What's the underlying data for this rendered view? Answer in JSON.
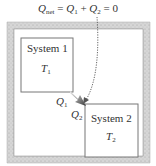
{
  "equation": {
    "lhs_symbol": "Q",
    "lhs_subscript": "net",
    "eq1": "=",
    "term1_symbol": "Q",
    "term1_subscript": "1",
    "plus": "+",
    "term2_symbol": "Q",
    "term2_subscript": "2",
    "eq2": "=",
    "rhs": "0"
  },
  "system1": {
    "label": "System 1",
    "temp_symbol": "T",
    "temp_subscript": "1"
  },
  "system2": {
    "label": "System 2",
    "temp_symbol": "T",
    "temp_subscript": "2"
  },
  "heat_labels": {
    "q1_symbol": "Q",
    "q1_subscript": "1",
    "q2_symbol": "Q",
    "q2_subscript": "2"
  },
  "colors": {
    "insulation": "#cfcfcf",
    "box_stroke": "#777777",
    "arrow_dark": "#444444",
    "arrow_light": "#dddddd",
    "dotted": "#666666"
  }
}
